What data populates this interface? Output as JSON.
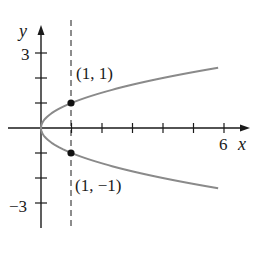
{
  "chart_data": {
    "type": "line",
    "title": "",
    "equation": "x = y^2",
    "xlabel": "x",
    "ylabel": "y",
    "xlim": [
      0,
      6.8
    ],
    "ylim": [
      -3.9,
      4
    ],
    "x_ticks": [
      1,
      2,
      3,
      4,
      5,
      6
    ],
    "x_tick_labels": [
      {
        "value": 6,
        "label": "6"
      }
    ],
    "y_ticks": [
      -3,
      -2,
      -1,
      1,
      2,
      3
    ],
    "y_tick_labels": [
      {
        "value": 3,
        "label": "3"
      },
      {
        "value": -3,
        "label": "−3"
      }
    ],
    "grid": false,
    "series": [
      {
        "name": "x = y^2",
        "color": "#8a8a8a",
        "points": [
          [
            5.8,
            -2.41
          ],
          [
            4.0,
            -2.0
          ],
          [
            2.25,
            -1.5
          ],
          [
            1.0,
            -1.0
          ],
          [
            0.25,
            -0.5
          ],
          [
            0,
            0
          ],
          [
            0.25,
            0.5
          ],
          [
            1.0,
            1.0
          ],
          [
            2.25,
            1.5
          ],
          [
            4.0,
            2.0
          ],
          [
            5.8,
            2.41
          ]
        ]
      }
    ],
    "vertical_line": {
      "x": 1,
      "style": "dashed"
    },
    "annotations": [
      {
        "point": [
          1,
          1
        ],
        "label": "(1, 1)"
      },
      {
        "point": [
          1,
          -1
        ],
        "label": "(1, −1)"
      }
    ]
  },
  "labels": {
    "x_axis": "x",
    "y_axis": "y",
    "tick_x6": "6",
    "tick_y3": "3",
    "tick_yneg3": "−3",
    "pt_upper": "(1, 1)",
    "pt_lower": "(1, −1)"
  },
  "colors": {
    "axis": "#1a1a1a",
    "curve": "#8a8a8a",
    "point": "#111111"
  }
}
